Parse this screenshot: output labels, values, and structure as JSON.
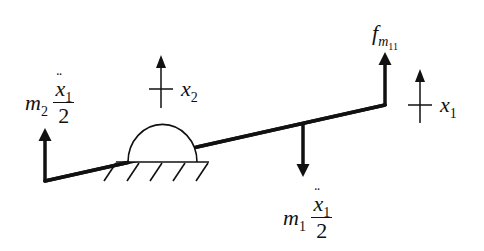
{
  "diagram": {
    "colors": {
      "stroke": "#111111",
      "background": "#ffffff"
    },
    "labels": {
      "left_force": {
        "mass": "m",
        "mass_sub": "2",
        "accel": "x",
        "accel_sub": "1",
        "denominator": "2"
      },
      "center_force": {
        "mass": "m",
        "mass_sub": "1",
        "accel": "x",
        "accel_sub": "1",
        "denominator": "2"
      },
      "right_force": {
        "symbol": "f",
        "sub": "m",
        "subsub": "11"
      },
      "x2": {
        "symbol": "x",
        "sub": "2"
      },
      "x1": {
        "symbol": "x",
        "sub": "1"
      }
    },
    "elements": [
      "beam",
      "pivot-support",
      "ground-hatch",
      "left-force-arrow-up",
      "center-force-arrow-down",
      "right-force-arrow-up",
      "x2-coordinate-marker",
      "x1-coordinate-marker"
    ]
  }
}
